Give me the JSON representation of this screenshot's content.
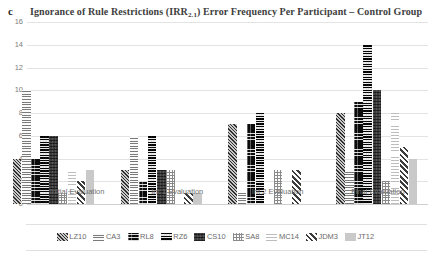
{
  "panel": {
    "letter": "c"
  },
  "title": {
    "prefix": "Ignorance of Rule Restrictions (IRR",
    "subscript": "2.1",
    "suffix": ") Error Frequency Per Participant  –  Control Group",
    "full": "Ignorance of Rule Restrictions (IRR2.1) Error Frequency Per Participant – Control Group"
  },
  "chart_data": {
    "type": "bar",
    "title": "Ignorance of Rule Restrictions (IRR2.1) Error Frequency Per Participant – Control Group",
    "xlabel": "",
    "ylabel": "",
    "ylim": [
      0,
      16
    ],
    "ytick_step": 2,
    "yticks": [
      "16",
      "14",
      "12",
      "10",
      "8",
      "6",
      "4",
      "2",
      "0"
    ],
    "grid": true,
    "legend_position": "bottom",
    "categories": [
      "Initial Evaluation",
      "Int 1 Evaluation",
      "Int 2 Evaluation",
      "Final Evaluation"
    ],
    "series": [
      {
        "name": "LZ10",
        "pattern": "diagonal-hatch-dark",
        "values": [
          4,
          3,
          7,
          8
        ]
      },
      {
        "name": "CA3",
        "pattern": "horizontal-lines-light",
        "values": [
          10,
          6,
          1,
          3
        ]
      },
      {
        "name": "RL8",
        "pattern": "checker-black",
        "values": [
          4,
          2,
          7,
          9
        ]
      },
      {
        "name": "RZ6",
        "pattern": "checkerboard-fine",
        "values": [
          6,
          6,
          8,
          14
        ]
      },
      {
        "name": "CS10",
        "pattern": "crosshatch-dark-gray",
        "values": [
          6,
          3,
          0,
          10
        ]
      },
      {
        "name": "SA8",
        "pattern": "crosshatch-light",
        "values": [
          1,
          3,
          3,
          2
        ]
      },
      {
        "name": "MC14",
        "pattern": "horizontal-lines-faint",
        "values": [
          3,
          0,
          0,
          8
        ]
      },
      {
        "name": "JDM3",
        "pattern": "diagonal-stripes-bold",
        "values": [
          2,
          1,
          3,
          5
        ]
      },
      {
        "name": "JT12",
        "pattern": "solid-light-gray",
        "values": [
          3,
          1,
          0,
          4
        ]
      }
    ]
  },
  "colors": {
    "gridline": "#e3e3e3",
    "axis_text": "#7d7d7d",
    "title_text": "#404040",
    "background": "#ffffff"
  }
}
